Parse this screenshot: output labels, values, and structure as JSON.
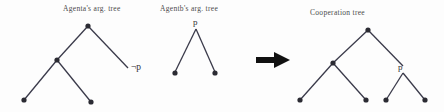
{
  "figure": {
    "background_color": "#fdfdfd",
    "edge_color": "#3a3a4a",
    "node_color": "#2b2b33",
    "arrow_color": "#111111",
    "captions": {
      "agent_a": "Agenta's arg. tree",
      "agent_b": "Agentb's arg. tree",
      "cooperation": "Cooperation tree"
    },
    "node_labels": {
      "agent_a_not_p": "¬p",
      "agent_b_p": "p",
      "cooperation_p": "p"
    },
    "arrow": {
      "name": "transformation-arrow",
      "direction": "right"
    },
    "trees": [
      {
        "id": "agent-a-tree",
        "caption": "Agenta's arg. tree",
        "nodes": [
          {
            "id": "a-root",
            "x": 88,
            "y": 26,
            "label": ""
          },
          {
            "id": "a-left",
            "x": 57,
            "y": 60,
            "label": ""
          },
          {
            "id": "a-right",
            "x": 128,
            "y": 70,
            "label": "¬p"
          },
          {
            "id": "a-ll",
            "x": 24,
            "y": 100,
            "label": ""
          },
          {
            "id": "a-lr",
            "x": 91,
            "y": 102,
            "label": ""
          }
        ],
        "edges": [
          [
            "a-root",
            "a-left"
          ],
          [
            "a-root",
            "a-right"
          ],
          [
            "a-left",
            "a-ll"
          ],
          [
            "a-left",
            "a-lr"
          ]
        ]
      },
      {
        "id": "agent-b-tree",
        "caption": "Agentb's arg. tree",
        "nodes": [
          {
            "id": "b-root",
            "x": 196,
            "y": 32,
            "label": "p"
          },
          {
            "id": "b-left",
            "x": 175,
            "y": 73,
            "label": ""
          },
          {
            "id": "b-right",
            "x": 215,
            "y": 73,
            "label": ""
          }
        ],
        "edges": [
          [
            "b-root",
            "b-left"
          ],
          [
            "b-root",
            "b-right"
          ]
        ]
      },
      {
        "id": "cooperation-tree",
        "caption": "Cooperation tree",
        "nodes": [
          {
            "id": "c-root",
            "x": 368,
            "y": 30,
            "label": ""
          },
          {
            "id": "c-left",
            "x": 333,
            "y": 63,
            "label": ""
          },
          {
            "id": "c-right",
            "x": 403,
            "y": 70,
            "label": "p"
          },
          {
            "id": "c-ll",
            "x": 300,
            "y": 100,
            "label": ""
          },
          {
            "id": "c-lr",
            "x": 366,
            "y": 100,
            "label": ""
          },
          {
            "id": "c-rl",
            "x": 386,
            "y": 100,
            "label": ""
          },
          {
            "id": "c-rr",
            "x": 425,
            "y": 100,
            "label": ""
          }
        ],
        "edges": [
          [
            "c-root",
            "c-left"
          ],
          [
            "c-root",
            "c-right"
          ],
          [
            "c-left",
            "c-ll"
          ],
          [
            "c-left",
            "c-lr"
          ],
          [
            "c-right",
            "c-rl"
          ],
          [
            "c-right",
            "c-rr"
          ]
        ]
      }
    ]
  }
}
